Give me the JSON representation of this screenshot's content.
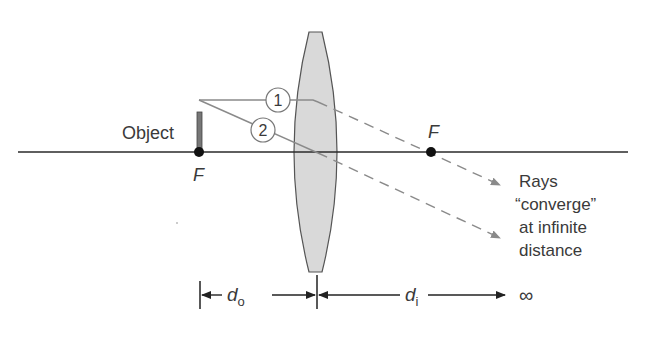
{
  "figure": {
    "object_label": "Object",
    "focal_left_label": "F",
    "focal_right_label": "F",
    "ray_1_label": "1",
    "ray_2_label": "2",
    "caption_lines": [
      "Rays",
      "“converge”",
      "at infinite",
      "distance"
    ],
    "do_label": "d",
    "do_sub": "o",
    "di_label": "d",
    "di_sub": "i",
    "infinity_symbol": "∞"
  },
  "colors": {
    "axis": "#2a2a2a",
    "ray": "#8a8a8a",
    "lens_fill": "#d9d9d9",
    "lens_stroke": "#555555",
    "object": "#777777",
    "text": "#3a3a3a"
  }
}
